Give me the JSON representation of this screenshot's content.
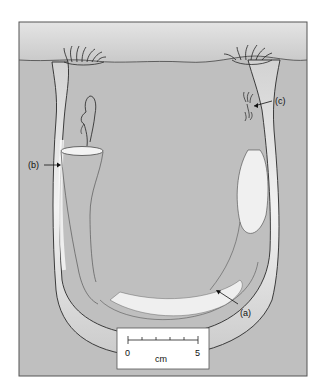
{
  "figure": {
    "labels": {
      "a": "(a)",
      "b": "(b)",
      "c": "(c)"
    },
    "scale_bar": {
      "start": "0",
      "end": "5",
      "unit": "cm",
      "ticks": 6
    }
  },
  "colors": {
    "water": "#cfcfcf",
    "sediment": "#bdbdbd",
    "frame": "#555555",
    "burrow": "#e6e6e6",
    "outline": "#2a2a2a"
  }
}
